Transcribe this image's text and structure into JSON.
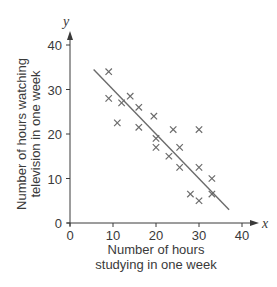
{
  "chart_data": {
    "type": "scatter",
    "title": "",
    "xlabel": "Number of hours studying in one week",
    "ylabel": "Number of hours watching television in one week",
    "xlabel_lines": [
      "Number of hours",
      "studying in one week"
    ],
    "ylabel_lines": [
      "Number of hours watching",
      "television in one week"
    ],
    "x_var": "x",
    "y_var": "y",
    "xlim": [
      0,
      40
    ],
    "ylim": [
      0,
      40
    ],
    "x_ticks": [
      0,
      10,
      20,
      30,
      40
    ],
    "y_ticks": [
      0,
      10,
      20,
      30,
      40
    ],
    "grid": false,
    "marker": "x",
    "series": [
      {
        "name": "Students",
        "points": [
          {
            "x": 9,
            "y": 34
          },
          {
            "x": 9,
            "y": 28
          },
          {
            "x": 11,
            "y": 22.5
          },
          {
            "x": 12,
            "y": 27
          },
          {
            "x": 14,
            "y": 28.5
          },
          {
            "x": 16,
            "y": 26
          },
          {
            "x": 16,
            "y": 21.5
          },
          {
            "x": 19.5,
            "y": 24
          },
          {
            "x": 20,
            "y": 19
          },
          {
            "x": 20,
            "y": 17
          },
          {
            "x": 23,
            "y": 15
          },
          {
            "x": 24,
            "y": 21
          },
          {
            "x": 25.5,
            "y": 17
          },
          {
            "x": 25.5,
            "y": 12.5
          },
          {
            "x": 28,
            "y": 6.5
          },
          {
            "x": 30,
            "y": 21
          },
          {
            "x": 30,
            "y": 12.5
          },
          {
            "x": 30,
            "y": 5
          },
          {
            "x": 33,
            "y": 10
          },
          {
            "x": 33,
            "y": 6.5
          }
        ]
      }
    ],
    "trend_line": {
      "x1": 5.5,
      "y1": 34.5,
      "x2": 37,
      "y2": 3
    },
    "colors": {
      "axis": "#3a3a3a",
      "marker": "#6b6b6b",
      "line": "#6b6b6b",
      "text": "#3a3a3a"
    }
  }
}
